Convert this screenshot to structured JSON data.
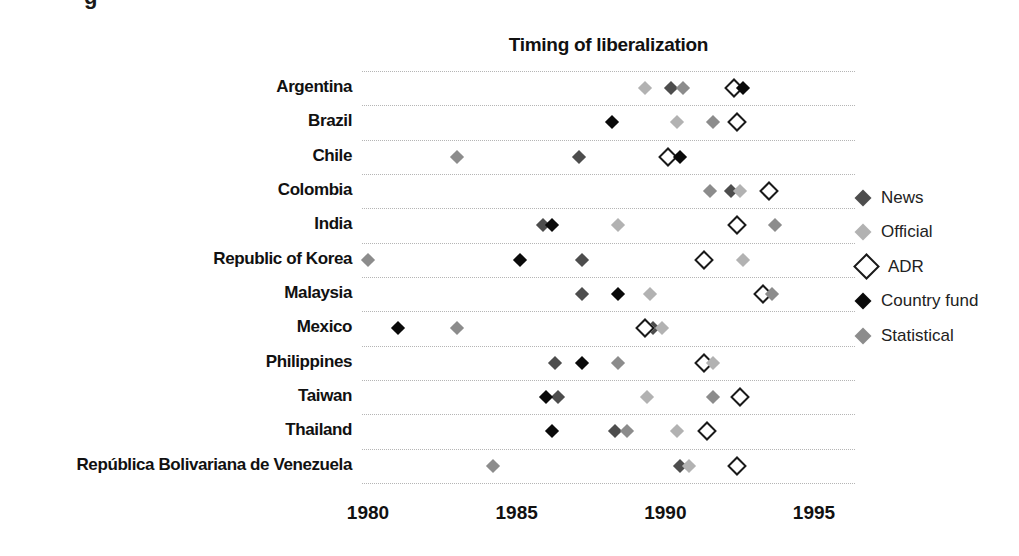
{
  "caption_fragment": "g",
  "marker_colors": {
    "News": "#4d4d4d",
    "Official": "#b2b2b2",
    "ADR": "#ffffff",
    "ADR_border": "#1a1a1a",
    "Country fund": "#0a0a0a",
    "Statistical": "#8c8c8c"
  },
  "legend": {
    "items": [
      {
        "label": "News",
        "type": "News"
      },
      {
        "label": "Official",
        "type": "Official"
      },
      {
        "label": "ADR",
        "type": "ADR"
      },
      {
        "label": "Country fund",
        "type": "Country fund"
      },
      {
        "label": "Statistical",
        "type": "Statistical"
      }
    ]
  },
  "chart_data": {
    "type": "scatter",
    "title": "Timing of liberalization",
    "xlabel": "",
    "ylabel": "",
    "x_range": [
      1979.7,
      1996.3
    ],
    "x_ticks": [
      1980,
      1985,
      1990,
      1995
    ],
    "x_tick_labels": [
      "1980",
      "1985",
      "1990",
      "1995"
    ],
    "grid": "horizontal-dotted",
    "legend_position": "right",
    "series_types": [
      "News",
      "Official",
      "ADR",
      "Country fund",
      "Statistical"
    ],
    "rows": [
      {
        "country": "Argentina",
        "events": [
          {
            "type": "Official",
            "year": 1989.3
          },
          {
            "type": "News",
            "year": 1990.2
          },
          {
            "type": "Statistical",
            "year": 1990.6
          },
          {
            "type": "ADR",
            "year": 1992.3
          },
          {
            "type": "Country fund",
            "year": 1992.6
          }
        ]
      },
      {
        "country": "Brazil",
        "events": [
          {
            "type": "Country fund",
            "year": 1988.2
          },
          {
            "type": "Official",
            "year": 1990.4
          },
          {
            "type": "Statistical",
            "year": 1991.6
          },
          {
            "type": "ADR",
            "year": 1992.4
          }
        ]
      },
      {
        "country": "Chile",
        "events": [
          {
            "type": "Statistical",
            "year": 1983.0
          },
          {
            "type": "News",
            "year": 1987.1
          },
          {
            "type": "ADR",
            "year": 1990.1
          },
          {
            "type": "Country fund",
            "year": 1990.5
          }
        ]
      },
      {
        "country": "Colombia",
        "events": [
          {
            "type": "Statistical",
            "year": 1991.5
          },
          {
            "type": "News",
            "year": 1992.2
          },
          {
            "type": "Official",
            "year": 1992.5
          },
          {
            "type": "ADR",
            "year": 1993.5
          }
        ]
      },
      {
        "country": "India",
        "events": [
          {
            "type": "News",
            "year": 1985.9
          },
          {
            "type": "Country fund",
            "year": 1986.2
          },
          {
            "type": "Official",
            "year": 1988.4
          },
          {
            "type": "ADR",
            "year": 1992.4
          },
          {
            "type": "Statistical",
            "year": 1993.7
          }
        ]
      },
      {
        "country": "Republic of Korea",
        "events": [
          {
            "type": "Statistical",
            "year": 1980.0
          },
          {
            "type": "Country fund",
            "year": 1985.1
          },
          {
            "type": "News",
            "year": 1987.2
          },
          {
            "type": "ADR",
            "year": 1991.3
          },
          {
            "type": "Official",
            "year": 1992.6
          }
        ]
      },
      {
        "country": "Malaysia",
        "events": [
          {
            "type": "News",
            "year": 1987.2
          },
          {
            "type": "Country fund",
            "year": 1988.4
          },
          {
            "type": "Official",
            "year": 1989.5
          },
          {
            "type": "ADR",
            "year": 1993.3
          },
          {
            "type": "Statistical",
            "year": 1993.6
          }
        ]
      },
      {
        "country": "Mexico",
        "events": [
          {
            "type": "Country fund",
            "year": 1981.0
          },
          {
            "type": "Statistical",
            "year": 1983.0
          },
          {
            "type": "News",
            "year": 1989.6
          },
          {
            "type": "Official",
            "year": 1989.9
          },
          {
            "type": "ADR",
            "year": 1989.3
          }
        ]
      },
      {
        "country": "Philippines",
        "events": [
          {
            "type": "News",
            "year": 1986.3
          },
          {
            "type": "Country fund",
            "year": 1987.2
          },
          {
            "type": "Statistical",
            "year": 1988.4
          },
          {
            "type": "ADR",
            "year": 1991.3
          },
          {
            "type": "Official",
            "year": 1991.6
          }
        ]
      },
      {
        "country": "Taiwan",
        "events": [
          {
            "type": "News",
            "year": 1986.4
          },
          {
            "type": "Country fund",
            "year": 1986.0
          },
          {
            "type": "Official",
            "year": 1989.4
          },
          {
            "type": "Statistical",
            "year": 1991.6
          },
          {
            "type": "ADR",
            "year": 1992.5
          }
        ]
      },
      {
        "country": "Thailand",
        "events": [
          {
            "type": "Country fund",
            "year": 1986.2
          },
          {
            "type": "News",
            "year": 1988.3
          },
          {
            "type": "Statistical",
            "year": 1988.7
          },
          {
            "type": "Official",
            "year": 1990.4
          },
          {
            "type": "ADR",
            "year": 1991.4
          }
        ]
      },
      {
        "country": "República Bolivariana de Venezuela",
        "events": [
          {
            "type": "Statistical",
            "year": 1984.2
          },
          {
            "type": "News",
            "year": 1990.5
          },
          {
            "type": "Official",
            "year": 1990.8
          },
          {
            "type": "ADR",
            "year": 1992.4
          }
        ]
      }
    ]
  }
}
